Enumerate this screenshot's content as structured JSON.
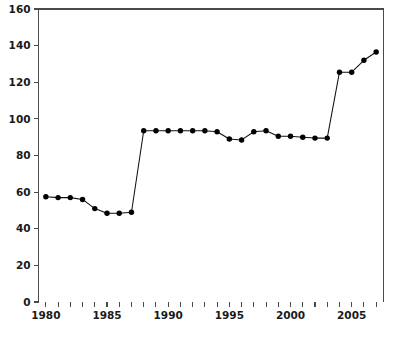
{
  "chart_data": {
    "type": "line",
    "title": "",
    "subtitle": "",
    "xlabel": "",
    "ylabel": "",
    "xlim": [
      1979.4,
      2007.6
    ],
    "ylim": [
      0,
      160
    ],
    "grid": false,
    "legend": null,
    "marker": "filled-circle",
    "line_color": "#111111",
    "marker_color": "#000000",
    "axis_color": "#4a4a4a",
    "background_color": "#ffffff",
    "x_tick_values": [
      1980,
      1981,
      1982,
      1983,
      1984,
      1985,
      1986,
      1987,
      1988,
      1989,
      1990,
      1991,
      1992,
      1993,
      1994,
      1995,
      1996,
      1997,
      1998,
      1999,
      2000,
      2001,
      2002,
      2003,
      2004,
      2005,
      2006,
      2007
    ],
    "x_tick_labels": [
      "1980",
      "",
      "",
      "",
      "",
      "1985",
      "",
      "",
      "",
      "",
      "1990",
      "",
      "",
      "",
      "",
      "1995",
      "",
      "",
      "",
      "",
      "2000",
      "",
      "",
      "",
      "",
      "2005",
      "",
      ""
    ],
    "y_tick_values": [
      0,
      20,
      40,
      60,
      80,
      100,
      120,
      140,
      160
    ],
    "y_tick_labels": [
      "0",
      "20",
      "40",
      "60",
      "80",
      "100",
      "120",
      "140",
      "160"
    ],
    "x": [
      1980,
      1981,
      1982,
      1983,
      1984,
      1985,
      1986,
      1987,
      1988,
      1989,
      1990,
      1991,
      1992,
      1993,
      1994,
      1995,
      1996,
      1997,
      1998,
      1999,
      2000,
      2001,
      2002,
      2003,
      2004,
      2005,
      2006,
      2007
    ],
    "values": [
      57.5,
      57.0,
      57.0,
      56.0,
      51.0,
      48.5,
      48.5,
      49.0,
      93.5,
      93.5,
      93.5,
      93.5,
      93.5,
      93.5,
      93.0,
      89.0,
      88.5,
      93.0,
      93.5,
      90.5,
      90.5,
      90.0,
      89.5,
      89.5,
      125.5,
      125.5,
      132.0,
      136.5
    ]
  }
}
